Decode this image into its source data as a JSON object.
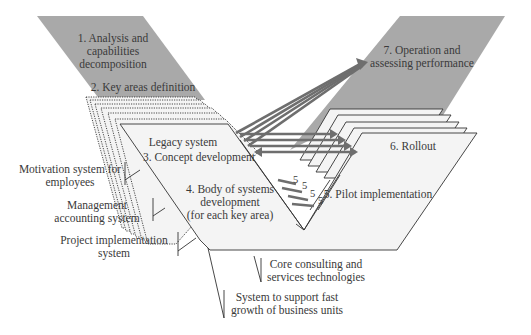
{
  "diagram": {
    "type": "V-model process diagram",
    "colors": {
      "grey_band": "#a9a9a9",
      "sheet_fill": "#f4f4f4",
      "arrow": "#6e6e6e",
      "text": "#3a3a3a"
    },
    "phases": {
      "p1": {
        "line1": "1. Analysis and",
        "line2": "capabilities",
        "line3": "decomposition"
      },
      "p2": {
        "label": "2. Key areas definition"
      },
      "p3": {
        "label": "3. Concept development"
      },
      "p4": {
        "line1": "4. Body of systems",
        "line2": "development",
        "line3": "(for each key area)"
      },
      "p5": {
        "label": "5. Pilot implementation"
      },
      "p6": {
        "label": "6. Rollout"
      },
      "p7": {
        "line1": "7. Operation and",
        "line2": "assessing performance"
      }
    },
    "legacy_label": "Legacy system",
    "five_markers": [
      "5",
      "5",
      "5",
      "5"
    ],
    "callouts": {
      "motivation": {
        "line1": "Motivation system for",
        "line2": "employees"
      },
      "management": {
        "line1": "Management",
        "line2": "accounting system"
      },
      "project": {
        "line1": "Project implementation",
        "line2": "system"
      },
      "core": {
        "line1": "Core consulting and",
        "line2": "services technologies"
      },
      "growth": {
        "line1": "System to support  fast",
        "line2": "growth  of business units"
      }
    }
  }
}
